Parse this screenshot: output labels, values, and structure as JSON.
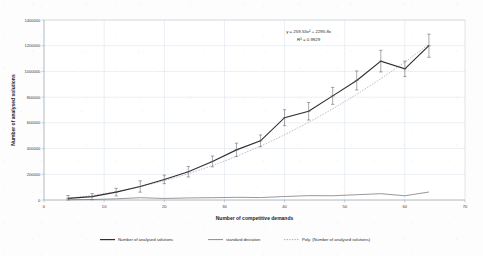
{
  "chart_data": {
    "type": "line",
    "title": "",
    "xlabel": "Number of competitive demands",
    "ylabel": "Number of analysed solutions",
    "xlim": [
      0,
      70
    ],
    "ylim": [
      0,
      1400000
    ],
    "xticks": [
      "0",
      "10",
      "20",
      "30",
      "40",
      "50",
      "60",
      "70"
    ],
    "yticks": [
      "0",
      "200000",
      "400000",
      "600000",
      "800000",
      "1000000",
      "1200000",
      "1400000"
    ],
    "grid": true,
    "legend_position": "bottom",
    "x": [
      4,
      8,
      12,
      16,
      20,
      24,
      28,
      32,
      36,
      40,
      44,
      48,
      52,
      56,
      60,
      64
    ],
    "series": [
      {
        "name": "Number of analysed solutions",
        "values": [
          13000,
          26000,
          61000,
          105000,
          160000,
          220000,
          300000,
          390000,
          460000,
          640000,
          690000,
          810000,
          930000,
          1080000,
          1020000,
          1200000
        ]
      },
      {
        "name": "standard deviation",
        "values": [
          2000,
          4000,
          9000,
          18000,
          12000,
          16000,
          18000,
          21000,
          19000,
          27000,
          34000,
          33000,
          41000,
          49000,
          33000,
          62000
        ]
      },
      {
        "name": "Poly. (Number of analysed solutions)",
        "values": [
          13334,
          34975,
          64924,
          103190,
          149766,
          204660,
          267864,
          339386,
          419220,
          507370,
          603832,
          708610,
          821700,
          943106,
          1072824,
          1210860
        ]
      }
    ],
    "error_bars": [
      22000,
      24000,
      30000,
      44000,
      33000,
      41000,
      42000,
      52000,
      46000,
      62000,
      68000,
      66000,
      74000,
      84000,
      60000,
      90000
    ],
    "annotations": [
      {
        "text": "y = 259.53x² + 2295.8x",
        "x": 44,
        "y": 1300000
      },
      {
        "text": "R² = 0.9929",
        "x": 44,
        "y": 1235000
      }
    ],
    "legend": [
      {
        "label": "Number of analysed solutions",
        "style": "solid-dark"
      },
      {
        "label": "standard deviation",
        "style": "solid-gray"
      },
      {
        "label": "Poly. (Number of analysed solutions)",
        "style": "dotted-gray"
      }
    ],
    "colors": {
      "main": "#2f2f33",
      "sd": "#6c6c72",
      "poly": "#8e8e95",
      "grid": "#d2dbe4",
      "text": "#2e2e2e",
      "background": "#fdfdfd"
    }
  }
}
